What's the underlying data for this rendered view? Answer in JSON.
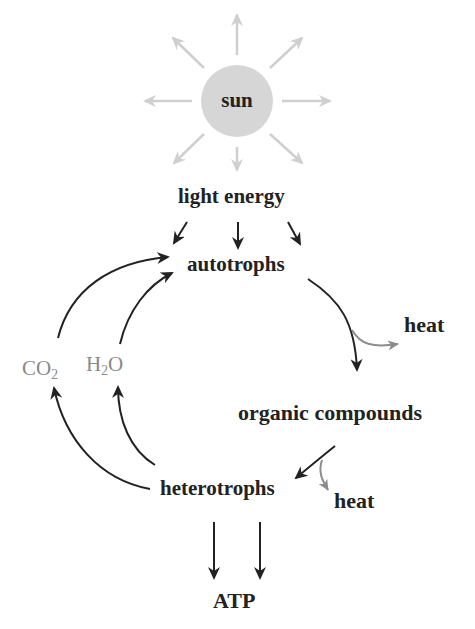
{
  "diagram": {
    "nodes": {
      "sun": "sun",
      "light_energy": "light energy",
      "autotrophs": "autotrophs",
      "heat_top": "heat",
      "organic_compounds": "organic compounds",
      "heterotrophs": "heterotrophs",
      "heat_bottom": "heat",
      "atp": "ATP",
      "co2": {
        "base": "CO",
        "sub": "2"
      },
      "h2o": {
        "base_a": "H",
        "sub": "2",
        "base_b": "O"
      }
    },
    "edges": [
      {
        "from": "sun",
        "to": "light_energy",
        "style": "gray rays (8)"
      },
      {
        "from": "light_energy",
        "to": "autotrophs",
        "count": 3
      },
      {
        "from": "autotrophs",
        "to": "organic_compounds"
      },
      {
        "from": "autotrophs",
        "to": "heat_top",
        "style": "gray"
      },
      {
        "from": "organic_compounds",
        "to": "heterotrophs"
      },
      {
        "from": "organic_compounds",
        "to": "heat_bottom",
        "style": "gray"
      },
      {
        "from": "heterotrophs",
        "to": "co2"
      },
      {
        "from": "heterotrophs",
        "to": "h2o"
      },
      {
        "from": "co2",
        "to": "autotrophs"
      },
      {
        "from": "h2o",
        "to": "autotrophs"
      },
      {
        "from": "heterotrophs",
        "to": "atp",
        "count": 2
      }
    ],
    "colors": {
      "text": "#222222",
      "arrow": "#222222",
      "gray_label": "#8a8a8a",
      "gray_arrow": "#8c8c8c",
      "sun_fill": "#d6d6d6",
      "sun_rays": "#cfcfcf"
    }
  }
}
